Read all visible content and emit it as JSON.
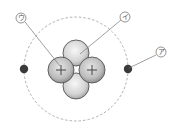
{
  "diagram": {
    "labels": [
      {
        "id": "a",
        "text": "ア",
        "points_to": "electron"
      },
      {
        "id": "i",
        "text": "イ",
        "points_to": "neutron"
      },
      {
        "id": "u",
        "text": "ウ",
        "points_to": "proton"
      }
    ],
    "proton_sign": "+",
    "colors": {
      "electron": "#3a3a3a",
      "particle_fill": "#d9d9d9",
      "particle_stroke": "#555555",
      "orbit": "#999999",
      "leader_line": "#777777"
    }
  }
}
